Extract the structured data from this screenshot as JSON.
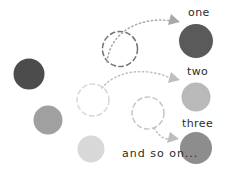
{
  "diagram": {
    "background_color": "#ffffff",
    "labels": {
      "one": "one",
      "two": "two",
      "three": "three",
      "and_so_on": "and so on..."
    },
    "source_circles": [
      {
        "name": "source-circle-dark",
        "cx": 29,
        "cy": 74,
        "r": 15.5,
        "color": "#4c4c4c"
      },
      {
        "name": "source-circle-medium",
        "cx": 48,
        "cy": 120,
        "r": 14.5,
        "color": "#a0a0a0"
      },
      {
        "name": "source-circle-light",
        "cx": 91,
        "cy": 149,
        "r": 13.5,
        "color": "#d8d8d8"
      }
    ],
    "dashed_circles": [
      {
        "name": "dashed-circle-dark",
        "cx": 120,
        "cy": 49,
        "r": 17.5,
        "color": "#777777"
      },
      {
        "name": "dashed-circle-medium",
        "cx": 93,
        "cy": 100,
        "r": 16.0,
        "color": "#dadada"
      },
      {
        "name": "dashed-circle-light",
        "cx": 148,
        "cy": 113,
        "r": 16.0,
        "color": "#c9c9c9"
      }
    ],
    "target_circles": [
      {
        "name": "target-circle-one",
        "cx": 196,
        "cy": 41,
        "r": 17.0,
        "color": "#5a5a5a",
        "label": "one"
      },
      {
        "name": "target-circle-two",
        "cx": 196,
        "cy": 97,
        "r": 14.5,
        "color": "#b9b9b9",
        "label": "two"
      },
      {
        "name": "target-circle-three",
        "cx": 196,
        "cy": 148,
        "r": 16.0,
        "color": "#8d8d8d",
        "label": "three"
      }
    ],
    "arrows": [
      {
        "name": "arrow-to-one",
        "color": "#a8a8a8",
        "from": "dashed-circle-dark",
        "to": "target-circle-one"
      },
      {
        "name": "arrow-to-two",
        "color": "#bfbfbf",
        "from": "dashed-circle-medium",
        "to": "target-circle-two"
      },
      {
        "name": "arrow-to-three",
        "color": "#bdbdbd",
        "from": "dashed-circle-light",
        "to": "target-circle-three"
      }
    ]
  }
}
